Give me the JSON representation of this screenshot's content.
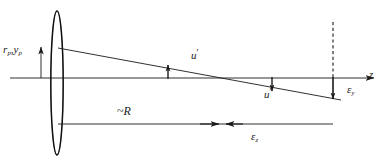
{
  "figure": {
    "type": "optical-ray-diagram",
    "colors": {
      "ink": "#1a1a1a",
      "background": "#ffffff",
      "lens_outline": "#111111"
    }
  },
  "labels": {
    "ray_height": {
      "symbol": "r",
      "subscript": "p",
      "symbol2": "y",
      "subscript2": "p",
      "text": "rₚ,yₚ"
    },
    "angle_upper": {
      "symbol": "u",
      "prime": "′",
      "text": "u′"
    },
    "angle_lower": {
      "symbol": "u",
      "prime": "′",
      "text": "u′"
    },
    "epsilon_y": {
      "symbol": "ε",
      "subscript": "y",
      "text": "εᵧ"
    },
    "epsilon_z": {
      "symbol": "ε",
      "subscript": "z",
      "text": "ε₂"
    },
    "radius": {
      "text": "~R",
      "tilde": "~",
      "symbol": "R"
    },
    "axis": {
      "symbol": "z",
      "text": "z"
    }
  },
  "elements": {
    "lens": {
      "name": "thin-lens",
      "shape": "biconvex-ellipse",
      "cx": 57,
      "cy": 83,
      "rx": 6,
      "ry": 72
    },
    "optical_axis": {
      "name": "optical-axis",
      "x1": 10,
      "x2": 378,
      "y": 78,
      "arrow": "right"
    },
    "marginal_ray": {
      "name": "marginal-ray",
      "x1": 58,
      "y1": 48,
      "x2": 340,
      "y2": 100
    },
    "height_arrow": {
      "name": "ray-height-arrow",
      "x": 41,
      "y1": 78,
      "y2": 47,
      "direction": "up"
    },
    "dashed_line": {
      "name": "image-plane-dashed-line",
      "x": 333,
      "y1": 22,
      "y2": 78,
      "style": "dashed"
    },
    "epsilon_y_arrow": {
      "name": "epsilon-y-arrow",
      "x": 333,
      "y1": 78,
      "y2": 99,
      "direction": "down"
    },
    "tick_upper": {
      "name": "angle-tick-upper",
      "x": 168,
      "y1": 78,
      "y2": 66
    },
    "tick_lower": {
      "name": "angle-tick-lower",
      "x": 272,
      "y1": 78,
      "y2": 88
    },
    "baseline": {
      "name": "longitudinal-baseline",
      "x1": 58,
      "x2": 333,
      "y": 124
    },
    "gap_arrow_left": {
      "name": "epsilon-z-gap-arrow-left",
      "x1": 198,
      "x2": 218,
      "y": 124,
      "direction": "right"
    },
    "gap_arrow_right": {
      "name": "epsilon-z-gap-arrow-right",
      "x1": 242,
      "x2": 224,
      "y": 124,
      "direction": "left"
    }
  }
}
